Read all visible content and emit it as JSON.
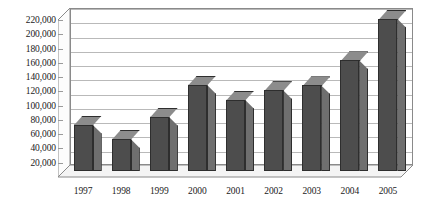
{
  "chart_data": {
    "type": "bar",
    "title": "",
    "subtitle": "",
    "xlabel": "",
    "ylabel": "",
    "categories": [
      "1997",
      "1998",
      "1999",
      "2000",
      "2001",
      "2002",
      "2003",
      "2004",
      "2005"
    ],
    "values": [
      65000,
      45000,
      76000,
      121000,
      100000,
      113000,
      120000,
      155000,
      213000
    ],
    "series": [
      {
        "name": "Series 1",
        "values": [
          65000,
          45000,
          76000,
          121000,
          100000,
          113000,
          120000,
          155000,
          213000
        ]
      }
    ],
    "ylim": [
      0,
      220000
    ],
    "ytick_values": [
      20000,
      40000,
      60000,
      80000,
      100000,
      120000,
      140000,
      160000,
      180000,
      200000,
      220000
    ],
    "ytick_labels": [
      "20,000",
      "40,000",
      "60,000",
      "80,000",
      "100,000",
      "120,000",
      "140,000",
      "160,000",
      "180,000",
      "200,000",
      "220,000"
    ],
    "grid": true,
    "grid_axis": "y",
    "legend": false,
    "legend_position": "none",
    "style": "3d-column",
    "colors": {
      "bar_front": "#4d4d4d",
      "bar_side": "#6f6f6f",
      "bar_top": "#8c8c8c",
      "bar_outline": "#2e2e2e",
      "gridline": "#b9b9b9",
      "axis_line": "#8a8a8a",
      "plot_background": "#ffffff",
      "floor": "#f2f2f2",
      "text": "#1a1a1a"
    }
  }
}
